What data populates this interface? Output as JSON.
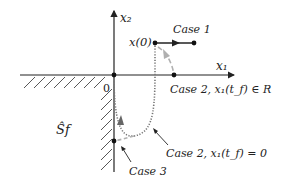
{
  "diagram": {
    "axes": {
      "x_label": "x₁",
      "y_label": "x₂",
      "origin_label": "0"
    },
    "region_label": "Ŝf",
    "initial_state_label": "x(0)",
    "cases": [
      {
        "id": "case1",
        "label": "Case 1"
      },
      {
        "id": "case2_R",
        "label": "Case 2, x₁(t_f) ∈ R"
      },
      {
        "id": "case2_0",
        "label": "Case 2, x₁(t_f) = 0"
      },
      {
        "id": "case3",
        "label": "Case 3"
      }
    ],
    "colors": {
      "axis": "#222222",
      "trajectory_dotted": "#777777",
      "trajectory_dashed": "#b0b0b0",
      "hatch": "#444444"
    }
  }
}
